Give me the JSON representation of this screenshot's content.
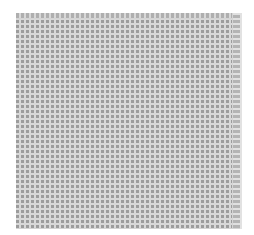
{
  "view": {
    "type": "cell-grid",
    "columns": 43,
    "rows": 42,
    "cell_pitch_px": 5,
    "cell_color": "#9c9c9c",
    "gap_color": "#d8d8d8"
  }
}
